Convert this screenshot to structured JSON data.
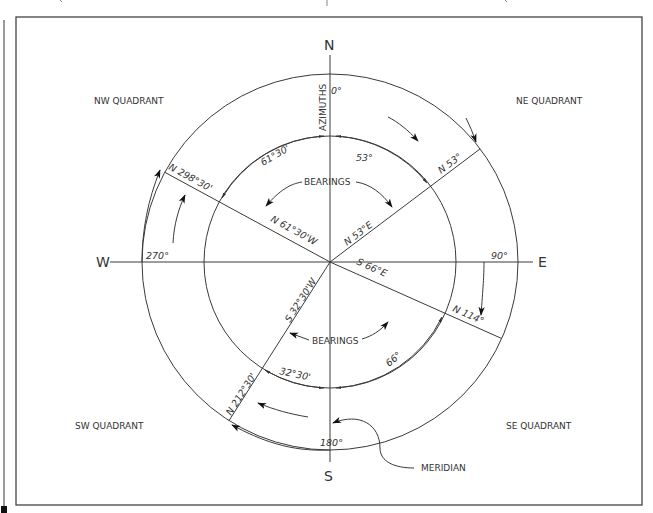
{
  "diagram": {
    "cardinals": {
      "north": "N",
      "south": "S",
      "east": "E",
      "west": "W"
    },
    "quadrants": {
      "nw": "NW QUADRANT",
      "ne": "NE QUADRANT",
      "sw": "SW QUADRANT",
      "se": "SE QUADRANT"
    },
    "azimuth_axis_label": "AZIMUTHS",
    "azimuth_degrees": {
      "north": "0°",
      "east": "90°",
      "south": "180°",
      "west": "270°"
    },
    "azimuth_lines": [
      {
        "label": "N 53°",
        "angle_deg": 53
      },
      {
        "label": "N 114°",
        "angle_deg": 114
      },
      {
        "label": "N 212°30'",
        "angle_deg": 212.5
      },
      {
        "label": "N 298°30'",
        "angle_deg": 298.5
      }
    ],
    "bearing_lines": [
      {
        "label": "N 53°E"
      },
      {
        "label": "S 66°E"
      },
      {
        "label": "S 32°30'W"
      },
      {
        "label": "N 61°30'W"
      }
    ],
    "bearing_angles": [
      {
        "label": "53°"
      },
      {
        "label": "61°30'"
      },
      {
        "label": "66°"
      },
      {
        "label": "32°30'"
      }
    ],
    "bearings_labels": {
      "upper": "BEARINGS",
      "lower": "BEARINGS"
    },
    "meridian_label": "MERIDIAN"
  }
}
